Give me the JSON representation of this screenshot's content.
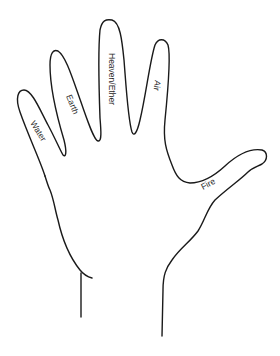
{
  "diagram": {
    "type": "hand-outline",
    "background": "#ffffff",
    "stroke_color": "#1a1a1a",
    "labels": {
      "pinky": "Water",
      "ring": "Earth",
      "middle": "Heaven/Ether",
      "index": "Air",
      "thumb": "Fire"
    }
  }
}
